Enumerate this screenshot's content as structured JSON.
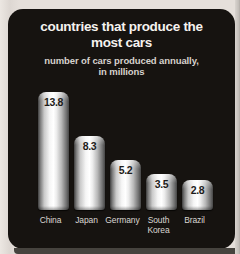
{
  "card": {
    "title_lines": [
      "countries that produce the",
      "most cars"
    ],
    "subtitle_lines": [
      "number of cars produced annually,",
      "in millions"
    ]
  },
  "chart_data": {
    "type": "bar",
    "title": "countries that produce the most cars",
    "subtitle": "number of cars produced annually, in millions",
    "categories": [
      "China",
      "Japan",
      "Germany",
      "South Korea",
      "Brazil"
    ],
    "values": [
      13.8,
      8.3,
      5.2,
      3.5,
      2.8
    ],
    "unit": "millions of cars",
    "ylim": [
      0,
      13.8
    ],
    "grid": false,
    "legend": false,
    "value_labels_shown": true,
    "colors": {
      "page_background": "#e5dfda",
      "card_background": "#161310",
      "title_text": "#f5f2ef",
      "subtitle_text": "#d6d2cd",
      "value_label_text": "#1d1c1a",
      "category_label_text": "#dbd7d2",
      "bar_metallic_light": "#ffffff",
      "bar_metallic_dark": "#454545"
    }
  }
}
